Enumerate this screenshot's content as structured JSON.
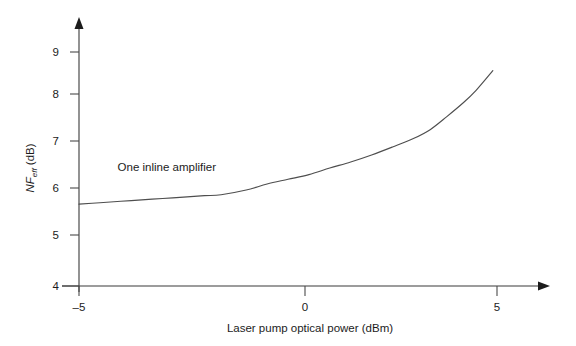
{
  "chart_data": {
    "type": "line",
    "title": "",
    "xlabel": "Laser pump optical power (dBm)",
    "ylabel": "NF_eff (dB)",
    "ylabel_parts": {
      "main": "NF",
      "subscript": "eff",
      "unit": " (dB)"
    },
    "xlim": [
      -5.9,
      5.9
    ],
    "ylim": [
      4,
      9.55
    ],
    "xticks": [
      -5,
      0,
      5
    ],
    "xticklabels": [
      "–5",
      "0",
      "5"
    ],
    "yticks": [
      4,
      5,
      6,
      7,
      8,
      9
    ],
    "yticklabels": [
      "4",
      "5",
      "6",
      "7",
      "8",
      "9"
    ],
    "grid": false,
    "legend": "none",
    "series": [
      {
        "name": "One inline amplifier",
        "x": [
          -5.0,
          -4.5,
          -4.0,
          -3.5,
          -3.0,
          -2.5,
          -2.0,
          -1.6,
          -1.0,
          -0.5,
          0.0,
          0.5,
          1.0,
          1.5,
          2.0,
          2.5,
          3.0,
          3.4,
          3.8,
          4.2,
          4.5,
          4.9
        ],
        "y": [
          5.75,
          5.78,
          5.81,
          5.84,
          5.87,
          5.9,
          5.93,
          5.95,
          6.05,
          6.18,
          6.28,
          6.38,
          6.52,
          6.65,
          6.8,
          6.97,
          7.15,
          7.34,
          7.62,
          7.92,
          8.18,
          8.6
        ]
      }
    ],
    "annotations": [
      {
        "text": "One inline amplifier",
        "x": -2.9,
        "y": 6.45
      }
    ],
    "colors": {
      "curve": "#4e4e4e",
      "axis": "#3a3a3a",
      "text": "#1c1c1c",
      "background": "#ffffff"
    }
  }
}
